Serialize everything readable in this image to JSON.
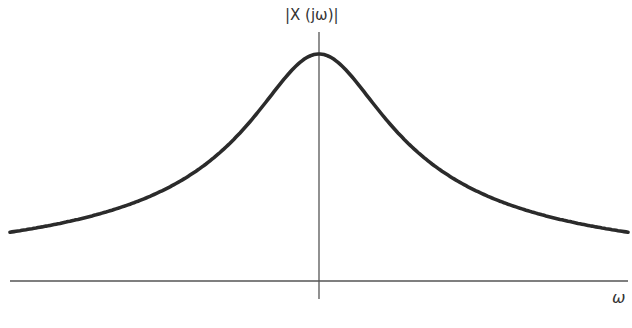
{
  "diagram": {
    "y_axis_label": "|X (jω)|",
    "x_axis_label": "ω",
    "colors": {
      "curve": "#2b2b2b",
      "axis": "#555555",
      "background": "#ffffff"
    }
  },
  "chart_data": {
    "type": "line",
    "title": "",
    "xlabel": "ω",
    "ylabel": "|X (jω)|",
    "grid": false,
    "x": [
      -4.5,
      -3,
      -2,
      -1.5,
      -1,
      -0.5,
      0,
      0.5,
      1,
      1.5,
      2,
      3,
      4.5
    ],
    "series": [
      {
        "name": "|X(jω)|",
        "values": [
          0.22,
          0.32,
          0.45,
          0.55,
          0.71,
          0.89,
          1.0,
          0.89,
          0.71,
          0.55,
          0.45,
          0.32,
          0.22
        ]
      }
    ]
  }
}
